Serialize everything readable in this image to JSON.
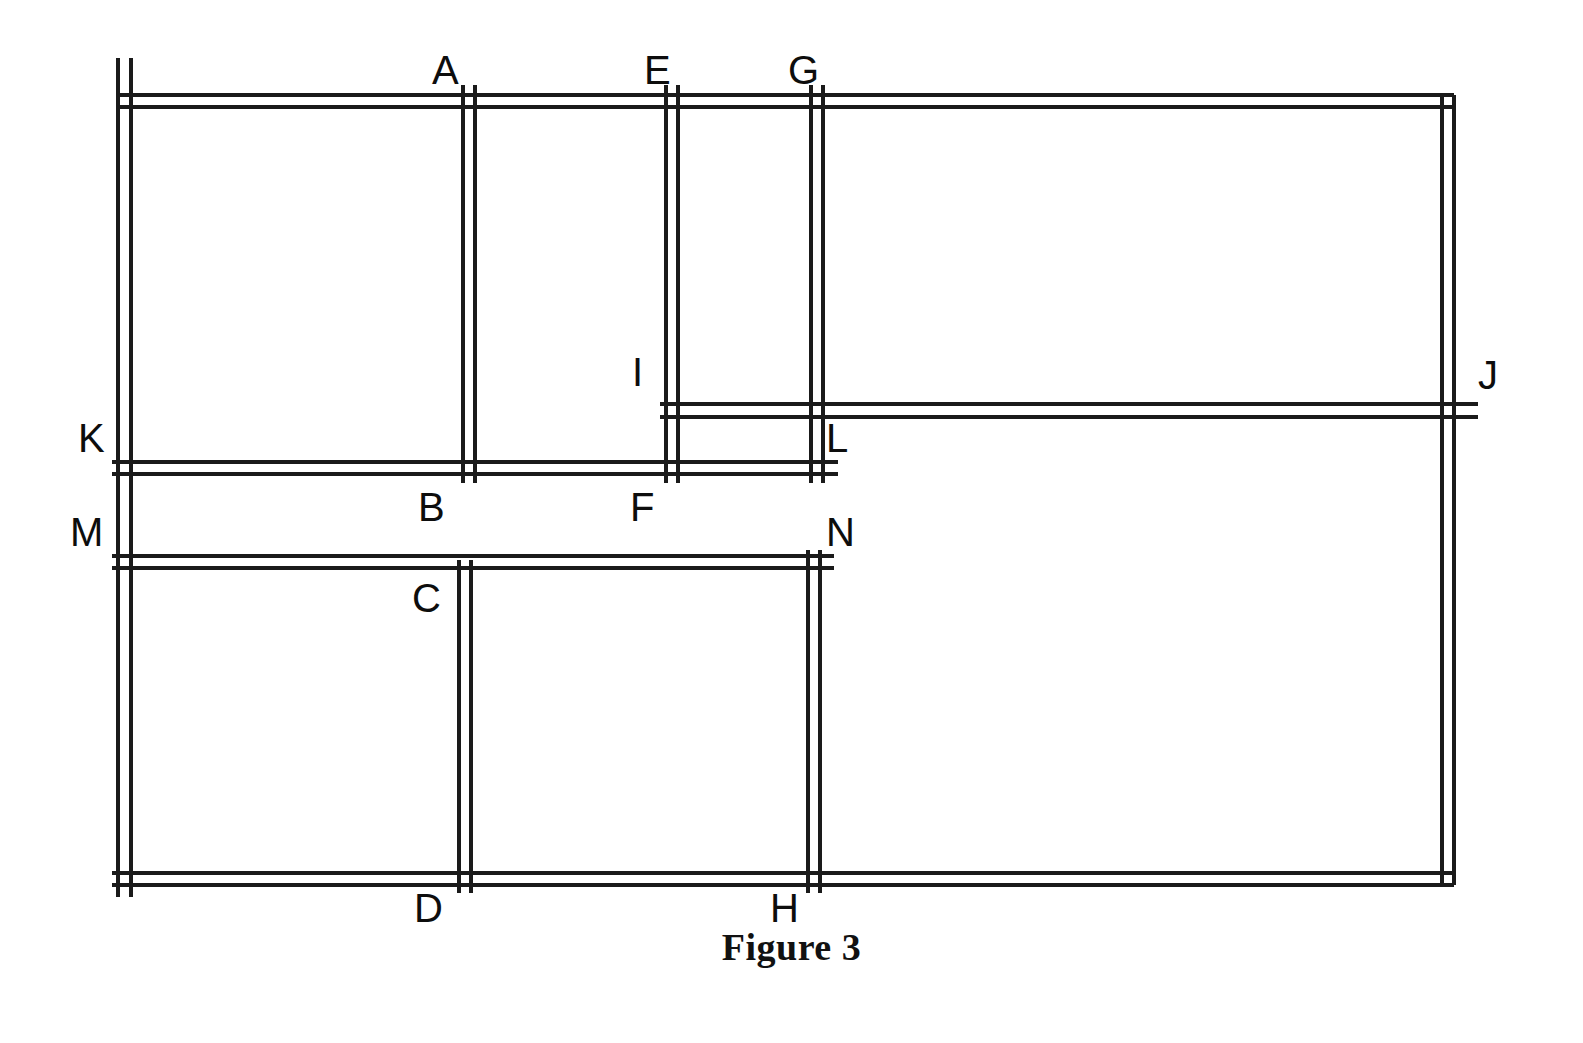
{
  "figure": {
    "caption": "Figure 3",
    "stroke_color": "#1a1a1a",
    "background_color": "#ffffff",
    "line_width": 3.2,
    "wall_gap": 9,
    "canvas": {
      "width": 1583,
      "height": 1043
    }
  },
  "labels": [
    {
      "id": "A",
      "text": "A",
      "x": 432,
      "y": 50,
      "anchor": "above-vertical-wall"
    },
    {
      "id": "B",
      "text": "B",
      "x": 418,
      "y": 487,
      "anchor": "below-vertical-wall"
    },
    {
      "id": "C",
      "text": "C",
      "x": 412,
      "y": 578,
      "anchor": "below-vertical-wall"
    },
    {
      "id": "D",
      "text": "D",
      "x": 414,
      "y": 888,
      "anchor": "below-vertical-wall"
    },
    {
      "id": "E",
      "text": "E",
      "x": 644,
      "y": 50,
      "anchor": "above-vertical-wall"
    },
    {
      "id": "F",
      "text": "F",
      "x": 630,
      "y": 487,
      "anchor": "below-vertical-wall"
    },
    {
      "id": "G",
      "text": "G",
      "x": 788,
      "y": 50,
      "anchor": "above-vertical-wall"
    },
    {
      "id": "H",
      "text": "H",
      "x": 770,
      "y": 888,
      "anchor": "below-vertical-wall"
    },
    {
      "id": "I",
      "text": "I",
      "x": 632,
      "y": 352,
      "anchor": "left-of-horizontal-wall"
    },
    {
      "id": "J",
      "text": "J",
      "x": 1478,
      "y": 355,
      "anchor": "right-of-horizontal-wall"
    },
    {
      "id": "K",
      "text": "K",
      "x": 78,
      "y": 418,
      "anchor": "left-of-horizontal-wall"
    },
    {
      "id": "L",
      "text": "L",
      "x": 826,
      "y": 418,
      "anchor": "right-of-horizontal-wall"
    },
    {
      "id": "M",
      "text": "M",
      "x": 70,
      "y": 512,
      "anchor": "left-of-horizontal-wall"
    },
    {
      "id": "N",
      "text": "N",
      "x": 826,
      "y": 512,
      "anchor": "right-of-horizontal-wall"
    }
  ],
  "geometry": {
    "vertical_walls": [
      {
        "id": "left-boundary-wall",
        "x1": 118,
        "x2": 131,
        "y_start": 58,
        "y_end": 897,
        "labels": [
          "K",
          "M"
        ]
      },
      {
        "id": "wall-A-B",
        "x1": 463,
        "x2": 475,
        "y_start": 85,
        "y_end": 483,
        "labels": [
          "A",
          "B"
        ]
      },
      {
        "id": "wall-C-D",
        "x1": 459,
        "x2": 471,
        "y_start": 560,
        "y_end": 893,
        "labels": [
          "C",
          "D"
        ]
      },
      {
        "id": "wall-E-F",
        "x1": 666,
        "x2": 678,
        "y_start": 85,
        "y_end": 483,
        "labels": [
          "E",
          "F"
        ]
      },
      {
        "id": "wall-G-L",
        "x1": 811,
        "x2": 823,
        "y_start": 85,
        "y_end": 483,
        "labels": [
          "G",
          "L"
        ]
      },
      {
        "id": "wall-N-H",
        "x1": 808,
        "x2": 820,
        "y_start": 550,
        "y_end": 893,
        "labels": [
          "N",
          "H"
        ]
      },
      {
        "id": "right-boundary-wall",
        "x1": 1442,
        "x2": 1454,
        "y_start": 95,
        "y_end": 885,
        "labels": [
          "J"
        ]
      }
    ],
    "horizontal_walls": [
      {
        "id": "top-boundary-wall",
        "y1": 95,
        "y2": 107,
        "x_start": 118,
        "x_end": 1454,
        "labels": [
          "A",
          "E",
          "G"
        ]
      },
      {
        "id": "wall-I-J",
        "y1": 404,
        "y2": 417,
        "x_start": 660,
        "x_end": 1478,
        "labels": [
          "I",
          "J"
        ]
      },
      {
        "id": "wall-K-L",
        "y1": 462,
        "y2": 474,
        "x_start": 112,
        "x_end": 838,
        "labels": [
          "K",
          "L"
        ]
      },
      {
        "id": "wall-M-N",
        "y1": 556,
        "y2": 568,
        "x_start": 112,
        "x_end": 834,
        "labels": [
          "M",
          "N"
        ]
      },
      {
        "id": "bottom-boundary-wall",
        "y1": 873,
        "y2": 885,
        "x_start": 112,
        "x_end": 1454,
        "labels": [
          "D",
          "H"
        ]
      }
    ]
  }
}
